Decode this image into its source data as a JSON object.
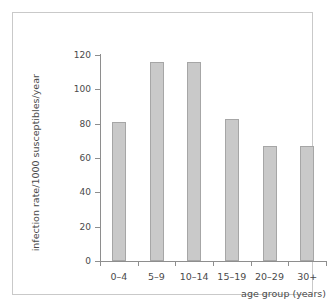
{
  "chart_data": {
    "type": "bar",
    "title": "",
    "categories": [
      "0–4",
      "5–9",
      "10–14",
      "15–19",
      "20–29",
      "30+"
    ],
    "values": [
      81,
      116,
      116,
      83,
      67,
      67
    ],
    "xlabel": "age group (years)",
    "ylabel": "infection rate/1000 susceptibles/year",
    "ylim": [
      0,
      120
    ],
    "yticks": [
      0,
      20,
      40,
      60,
      80,
      100,
      120
    ],
    "ytick_labels": [
      "0",
      "20",
      "40",
      "60",
      "80",
      "100",
      "120"
    ],
    "grid": false,
    "legend": null,
    "bar_color": "#c9c9c9",
    "bar_edge_color": "#a6a6a6",
    "axis_color": "#8e8e8e",
    "text_color": "#4a4a4a",
    "background": "#ffffff",
    "frame_color": "#c9c9c9"
  }
}
